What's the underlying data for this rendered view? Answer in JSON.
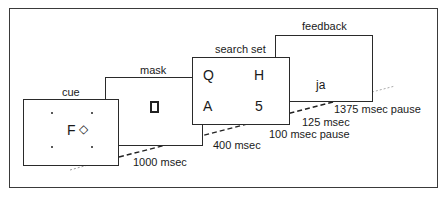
{
  "diagram": {
    "frames": [
      {
        "name": "cue",
        "label": "cue",
        "content": {
          "letter": "F",
          "symbol": "◇"
        }
      },
      {
        "name": "mask",
        "label": "mask",
        "content": {
          "symbol": "⌘"
        }
      },
      {
        "name": "search set",
        "label": "search set",
        "content": {
          "items": [
            "Q",
            "H",
            "A",
            "5"
          ]
        }
      },
      {
        "name": "feedback",
        "label": "feedback",
        "content": {
          "text": "ja"
        }
      }
    ],
    "timings": {
      "cue": "1000 msec",
      "mask": "400 msec",
      "pause1": "100 msec pause",
      "search": "125 msec",
      "pause2": "1375 msec pause"
    }
  }
}
